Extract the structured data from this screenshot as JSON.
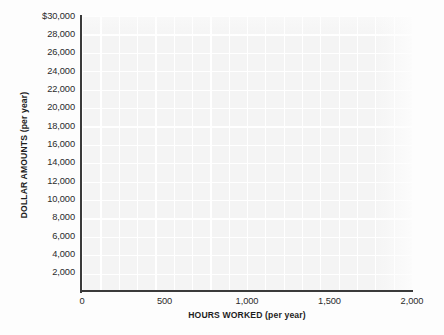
{
  "chart_data": {
    "type": "scatter",
    "title": "",
    "subtitle": "",
    "xlabel": "HOURS WORKED (per year)",
    "ylabel": "DOLLAR AMOUNTS (per year)",
    "xlim": [
      0,
      2000
    ],
    "ylim": [
      0,
      30000
    ],
    "x_ticks": [
      0,
      500,
      1000,
      1500,
      2000
    ],
    "x_tick_labels": [
      "0",
      "500",
      "1,000",
      "1,500",
      "2,000"
    ],
    "y_ticks": [
      2000,
      4000,
      6000,
      8000,
      10000,
      12000,
      14000,
      16000,
      18000,
      20000,
      22000,
      24000,
      26000,
      28000,
      30000
    ],
    "y_tick_labels": [
      "2,000",
      "4,000",
      "6,000",
      "8,000",
      "10,000",
      "12,000",
      "14,000",
      "16,000",
      "18,000",
      "20,000",
      "22,000",
      "24,000",
      "26,000",
      "28,000",
      "$30,000"
    ],
    "grid": true,
    "grid_style": "white minor grid on light gray panel",
    "legend": null,
    "series": [],
    "values": [],
    "annotations": [],
    "note": "Empty blank graph grid with labeled axes and no plotted data series"
  },
  "colors": {
    "page_background": "#fdfdfd",
    "plot_background": "#f4f4f4",
    "grid_line": "#ffffff",
    "axis_line": "#3a3a3a",
    "tick_text": "#2b2b2b",
    "axis_title_text": "#1d1d1d"
  }
}
